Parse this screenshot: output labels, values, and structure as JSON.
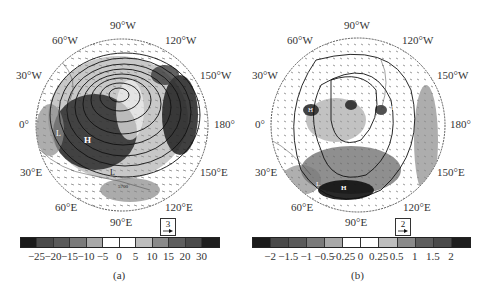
{
  "figure": {
    "panels": [
      {
        "id": "a",
        "caption": "(a)",
        "longitude_labels": {
          "top": "90°W",
          "upper_left": "60°W",
          "upper_right": "120°W",
          "mid_upper_left": "30°W",
          "mid_upper_right": "150°W",
          "left": "0°",
          "right": "180°",
          "mid_lower_left": "30°E",
          "mid_lower_right": "150°E",
          "lower_left": "60°E",
          "lower_right": "120°E",
          "bottom": "90°E"
        },
        "vector_legend": {
          "value": "3"
        },
        "colorbar": {
          "ticks": [
            "−25",
            "−20",
            "−15",
            "−10",
            "−5",
            "0",
            "5",
            "10",
            "15",
            "20",
            "30"
          ],
          "colors": [
            "#1a1a1a",
            "#4a4a4a",
            "#5a5a5a",
            "#7a7a7a",
            "#a8a8a8",
            "#ffffff",
            "#ffffff",
            "#bdbdbd",
            "#8a8a8a",
            "#5e5e5e",
            "#4a4a4a",
            "#1e1e1e"
          ]
        },
        "map_labels": [
          "H",
          "H",
          "L",
          "L",
          "5700"
        ]
      },
      {
        "id": "b",
        "caption": "(b)",
        "longitude_labels": {
          "top": "90°W",
          "upper_left": "60°W",
          "upper_right": "120°W",
          "mid_upper_left": "30°W",
          "mid_upper_right": "150°W",
          "left": "0°",
          "right": "180°",
          "mid_lower_left": "30°E",
          "mid_lower_right": "150°E",
          "lower_left": "60°E",
          "lower_right": "120°E",
          "bottom": "90°E"
        },
        "vector_legend": {
          "value": "2"
        },
        "colorbar": {
          "ticks": [
            "−2",
            "−1.5",
            "−1",
            "−0.5",
            "−0.25",
            "0",
            "0.25",
            "0.5",
            "1",
            "1.5",
            "2"
          ],
          "colors": [
            "#1a1a1a",
            "#4a4a4a",
            "#5a5a5a",
            "#7a7a7a",
            "#a8a8a8",
            "#ffffff",
            "#ffffff",
            "#bdbdbd",
            "#8a8a8a",
            "#5e5e5e",
            "#4a4a4a",
            "#1e1e1e"
          ]
        },
        "map_labels": [
          "H",
          "H",
          "L",
          "L"
        ]
      }
    ]
  }
}
